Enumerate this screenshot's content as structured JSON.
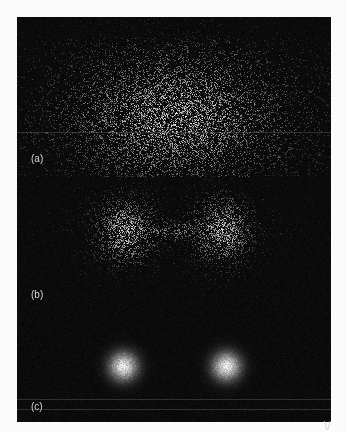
{
  "figure": {
    "background": "#050505",
    "page_background": "#fbfbfb",
    "panels": [
      {
        "id": "a",
        "label": "(a)",
        "pattern": "broad-speckle-fan",
        "label_x": 14,
        "label_y": 142
      },
      {
        "id": "b",
        "label": "(b)",
        "pattern": "bowtie-speckle",
        "label_x": 14,
        "label_y": 278
      },
      {
        "id": "c",
        "label": "(c)",
        "pattern": "two-focused-spots",
        "label_x": 14,
        "label_y": 390
      }
    ],
    "scanlines_y": [
      115,
      382,
      392
    ],
    "corner_mark": "\\/"
  }
}
